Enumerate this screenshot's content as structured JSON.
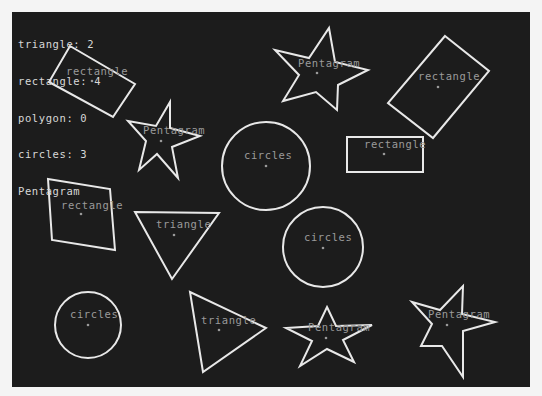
{
  "colors": {
    "page_background": "#f4f4f4",
    "canvas_background": "#1c1c1c",
    "shape_stroke": "#e8e8e8",
    "label_text": "#9a9a9a",
    "legend_text": "#d8d8d8"
  },
  "legend": {
    "lines": [
      "triangle: 2",
      "rectangle: 4",
      "polygon: 0",
      "circles: 3",
      "Pentagram"
    ]
  },
  "shapes": [
    {
      "type": "rectangle",
      "label": "rectangle",
      "points": "70,46 135,84 113,117 49,82",
      "center": [
        92,
        81
      ],
      "label_pos": [
        66,
        75
      ]
    },
    {
      "type": "pentagram",
      "label": "Pentagram",
      "points": "329,28 335,62 368,70 338,85 337,110 316,92 283,101 299,75 275,50 309,58",
      "center": [
        317,
        73
      ],
      "label_pos": [
        298,
        67
      ]
    },
    {
      "type": "rectangle",
      "label": "rectangle",
      "points": "445,36 489,71 433,138 388,103",
      "center": [
        438,
        87
      ],
      "label_pos": [
        418,
        80
      ]
    },
    {
      "type": "pentagram",
      "label": "Pentagram",
      "points": "170,102 170,128 200,136 172,147 178,178 157,154 139,170 146,141 128,121 156,126",
      "center": [
        161,
        141
      ],
      "label_pos": [
        143,
        134
      ]
    },
    {
      "type": "circle",
      "label": "circles",
      "cx": 266,
      "cy": 166,
      "r": 44,
      "center": [
        266,
        166
      ],
      "label_pos": [
        244,
        159
      ]
    },
    {
      "type": "rectangle",
      "label": "rectangle",
      "points": "347,137 423,137 423,172 347,172",
      "center": [
        384,
        154
      ],
      "label_pos": [
        364,
        148
      ]
    },
    {
      "type": "rectangle",
      "label": "rectangle",
      "points": "48,179 110,189 115,250 52,240",
      "center": [
        81,
        214
      ],
      "label_pos": [
        61,
        209
      ]
    },
    {
      "type": "triangle",
      "label": "triangle",
      "points": "135,212 219,213 172,279",
      "center": [
        174,
        235
      ],
      "label_pos": [
        156,
        228
      ]
    },
    {
      "type": "circle",
      "label": "circles",
      "cx": 323,
      "cy": 247,
      "r": 40,
      "center": [
        323,
        248
      ],
      "label_pos": [
        304,
        241
      ]
    },
    {
      "type": "circle",
      "label": "circles",
      "cx": 88,
      "cy": 325,
      "r": 33,
      "center": [
        88,
        325
      ],
      "label_pos": [
        70,
        318
      ]
    },
    {
      "type": "triangle",
      "label": "triangle",
      "points": "190,292 266,328 203,372",
      "center": [
        219,
        330
      ],
      "label_pos": [
        201,
        324
      ]
    },
    {
      "type": "pentagram",
      "label": "Pentagram",
      "points": "327,307 336,326 372,325 343,340 354,362 327,349 300,366 312,341 286,328 318,326",
      "center": [
        326,
        338
      ],
      "label_pos": [
        308,
        331
      ]
    },
    {
      "type": "pentagram",
      "label": "Pentagram",
      "points": "463,286 462,314 495,322 463,331 463,377 442,346 421,346 432,324 412,302 440,310",
      "center": [
        447,
        325
      ],
      "label_pos": [
        428,
        318
      ]
    }
  ]
}
